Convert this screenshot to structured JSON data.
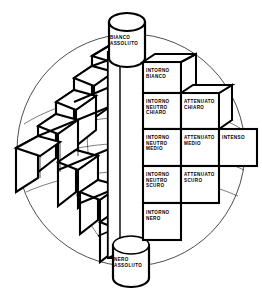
{
  "figure": {
    "type": "color-solid-diagram",
    "language": "it",
    "background_color": "#ffffff",
    "stroke_color": "#000000"
  },
  "axis": {
    "top_label": "BIANCO\nASSOLUTO",
    "bottom_label": "NERO\nASSOLUTO"
  },
  "cells": [
    {
      "id": "intorno-bianco",
      "label": "INTORNO\nBIANCO",
      "x": 146,
      "y": 68,
      "column": 1,
      "row": 1
    },
    {
      "id": "intorno-neutro-chiaro",
      "label": "INTORNO\nNEUTRO\nCHIARO",
      "x": 146,
      "y": 99,
      "column": 1,
      "row": 2
    },
    {
      "id": "attenuato-chiaro",
      "label": "ATTENUATO\nCHIARO",
      "x": 184,
      "y": 99,
      "column": 2,
      "row": 2
    },
    {
      "id": "intorno-neutro-medio",
      "label": "INTORNO\nNEUTRO\nMEDIO",
      "x": 146,
      "y": 135,
      "column": 1,
      "row": 3
    },
    {
      "id": "attenuato-medio",
      "label": "ATTENUATO\nMEDIO",
      "x": 184,
      "y": 135,
      "column": 2,
      "row": 3
    },
    {
      "id": "intenso",
      "label": "INTENSO",
      "x": 222,
      "y": 135,
      "column": 3,
      "row": 3
    },
    {
      "id": "intorno-neutro-scuro",
      "label": "INTORNO\nNEUTRO\nSCURO",
      "x": 146,
      "y": 172,
      "column": 1,
      "row": 4
    },
    {
      "id": "attenuato-scuro",
      "label": "ATTENUATO\nSCURO",
      "x": 184,
      "y": 172,
      "column": 2,
      "row": 4
    },
    {
      "id": "intorno-nero",
      "label": "INTORNO\nNERO",
      "x": 146,
      "y": 210,
      "column": 1,
      "row": 5
    }
  ]
}
